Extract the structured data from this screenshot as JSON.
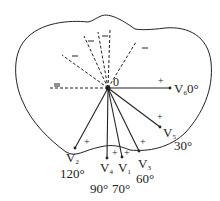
{
  "diagram": {
    "center_label": "0",
    "colors": {
      "line": "#222222",
      "background": "#ffffff"
    },
    "leads": [
      {
        "name": "V6",
        "letter": "V",
        "sub": "6",
        "angle": "0°",
        "plus": "+"
      },
      {
        "name": "V5",
        "letter": "V",
        "sub": "5",
        "angle": "30°",
        "plus": "+"
      },
      {
        "name": "V3",
        "letter": "V",
        "sub": "3",
        "angle": "60°",
        "plus": "+"
      },
      {
        "name": "V1",
        "letter": "V",
        "sub": "1",
        "angle": "70°",
        "plus": "+"
      },
      {
        "name": "V4",
        "letter": "V",
        "sub": "4",
        "angle": "90°",
        "plus": "+"
      },
      {
        "name": "V2",
        "letter": "V",
        "sub": "2",
        "angle": "120°",
        "plus": "+"
      }
    ],
    "negative_sign": "−"
  }
}
